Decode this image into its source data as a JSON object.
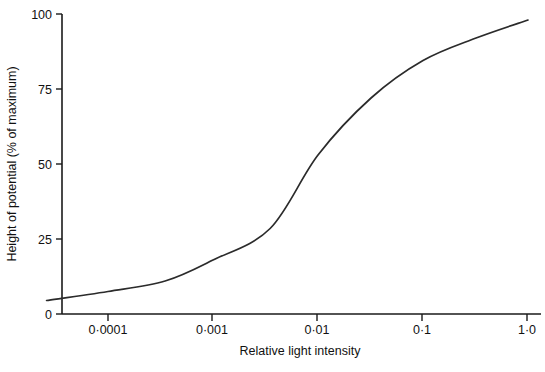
{
  "chart_data": {
    "type": "line",
    "title": "",
    "xlabel": "Relative light intensity",
    "ylabel": "Height of potential (% of maximum)",
    "xscale": "log",
    "xlim": [
      2.5e-05,
      1.1
    ],
    "ylim": [
      0,
      100
    ],
    "grid": false,
    "legend": null,
    "xtick_labels": [
      "0·0001",
      "0·001",
      "0·01",
      "0·1",
      "1·0"
    ],
    "xtick_values": [
      0.0001,
      0.001,
      0.01,
      0.1,
      1.0
    ],
    "ytick_labels": [
      "0",
      "25",
      "50",
      "75",
      "100"
    ],
    "ytick_values": [
      0,
      25,
      50,
      75,
      100
    ],
    "series": [
      {
        "name": "Height of potential",
        "x": [
          2.6e-05,
          0.0001,
          0.00035,
          0.001,
          0.0035,
          0.01,
          0.032,
          0.1,
          0.32,
          1.0
        ],
        "y": [
          4.5,
          7.5,
          11.0,
          18.0,
          28.5,
          53.0,
          72.0,
          84.5,
          92.0,
          98.0
        ]
      }
    ]
  },
  "axis_geometry": {
    "x_origin_px": 62,
    "x_end_px": 540,
    "y_zero_px": 314,
    "y_top_px": 14,
    "decade_px": 105,
    "x_first_tick_px": 108
  },
  "caption": {
    "text": ""
  },
  "colors": {
    "curve": "#2b2b2b",
    "axis": "#1a1a1a",
    "text": "#111111",
    "background": "#ffffff"
  }
}
